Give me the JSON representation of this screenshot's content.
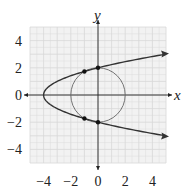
{
  "chart_data": {
    "type": "line",
    "title": "",
    "xlabel": "x",
    "ylabel": "y",
    "xlim": [
      -5,
      5
    ],
    "ylim": [
      -5,
      5
    ],
    "grid": true,
    "x_ticks": [
      "-4",
      "-2",
      "0",
      "2",
      "4"
    ],
    "y_ticks": [
      "4",
      "2",
      "0",
      "-2",
      "-4"
    ],
    "x_tick_values": [
      -4,
      -2,
      0,
      2,
      4
    ],
    "y_tick_values": [
      4,
      2,
      0,
      -2,
      -4
    ],
    "series": [
      {
        "name": "parabola",
        "equation": "x = y^2 - 4",
        "vertex": [
          -4,
          0
        ],
        "arrow_ends": [
          [
            5,
            3
          ],
          [
            5,
            -3
          ]
        ]
      },
      {
        "name": "circle",
        "equation": "x^2 + y^2 = 4",
        "center": [
          0,
          0
        ],
        "radius": 2
      }
    ],
    "points": [
      [
        0,
        2
      ],
      [
        0,
        -2
      ],
      [
        -1,
        1.732
      ],
      [
        -1,
        -1.732
      ]
    ]
  },
  "colors": {
    "curve": "#333333",
    "grid": "#d8d8d8",
    "gridbg": "#f2f2f2",
    "axis": "#222222"
  }
}
